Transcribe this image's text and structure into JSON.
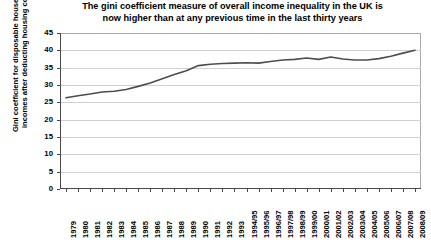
{
  "chart_data": {
    "type": "line",
    "title": "The gini coefficient measure of overall income inequality in the UK is now higher than at any previous time in the last thirty years",
    "title_line1": "The gini coefficient measure of overall income inequality in the UK is",
    "title_line2": "now higher than at any previous time in the last thirty years",
    "xlabel": "",
    "ylabel": "Gini coefficient for disposable household incomes after deducting housing costs",
    "ylim": [
      0,
      45
    ],
    "yticks": [
      0,
      5,
      10,
      15,
      20,
      25,
      30,
      35,
      40,
      45
    ],
    "grid": true,
    "legend": "none",
    "line_color": "#4d4d4d",
    "categories": [
      "1979",
      "1980",
      "1981",
      "1982",
      "1983",
      "1984",
      "1985",
      "1986",
      "1987",
      "1988",
      "1989",
      "1990",
      "1991",
      "1992",
      "1993",
      "1994/95",
      "1995/96",
      "1996/97",
      "1997/98",
      "1998/99",
      "1999/00",
      "2000/01",
      "2001/02",
      "2002/03",
      "2003/04",
      "2004/05",
      "2005/06",
      "2006/07",
      "2007/08",
      "2008/09"
    ],
    "values": [
      26.3,
      26.9,
      27.4,
      28.0,
      28.2,
      28.7,
      29.6,
      30.6,
      31.8,
      33.0,
      34.1,
      35.6,
      36.0,
      36.2,
      36.3,
      36.4,
      36.3,
      36.8,
      37.2,
      37.4,
      37.8,
      37.4,
      38.1,
      37.5,
      37.2,
      37.2,
      37.6,
      38.3,
      39.2,
      40.0
    ]
  }
}
